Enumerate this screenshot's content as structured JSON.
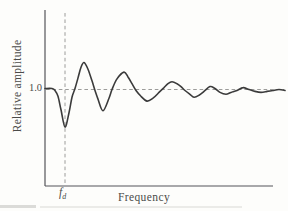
{
  "figure": {
    "ylabel": "Relative amplitude",
    "xlabel": "Frequency",
    "ytick_label": "1.0",
    "fd_symbol": "f",
    "fd_subscript": "d"
  },
  "colors": {
    "background": "#fdfdfb",
    "curve": "#3b3b3b",
    "axis": "#55555a",
    "dashed_line": "#9c9c9a",
    "text": "#4b4b49",
    "scan_artifact": "#c9c9c5"
  },
  "chart_data": {
    "type": "line",
    "title": "",
    "xlabel": "Frequency",
    "ylabel": "Relative amplitude",
    "x_unit": "f / fd (frequency normalized to fd)",
    "xlim": [
      0,
      12
    ],
    "ylim": [
      0,
      1.82
    ],
    "yticks": [
      1.0
    ],
    "xticks": [
      {
        "value": 1.0,
        "label": "fd"
      }
    ],
    "grid": false,
    "legend": null,
    "reference_amplitude": 1.0,
    "dip_frequency": 1.0,
    "dip_amplitude": 0.61,
    "peak_amplitude": 1.28,
    "points": [
      [
        0.0,
        1.01
      ],
      [
        0.35,
        1.01
      ],
      [
        0.5,
        0.99
      ],
      [
        0.65,
        0.93
      ],
      [
        0.8,
        0.79
      ],
      [
        1.0,
        0.61
      ],
      [
        1.2,
        0.76
      ],
      [
        1.35,
        0.92
      ],
      [
        1.5,
        1.01
      ],
      [
        1.65,
        1.12
      ],
      [
        1.8,
        1.23
      ],
      [
        1.95,
        1.28
      ],
      [
        2.15,
        1.21
      ],
      [
        2.35,
        1.09
      ],
      [
        2.5,
        0.99
      ],
      [
        2.65,
        0.9
      ],
      [
        2.9,
        0.78
      ],
      [
        3.2,
        0.91
      ],
      [
        3.35,
        1.0
      ],
      [
        3.6,
        1.11
      ],
      [
        3.95,
        1.18
      ],
      [
        4.15,
        1.13
      ],
      [
        4.35,
        1.06
      ],
      [
        4.55,
        0.99
      ],
      [
        4.8,
        0.93
      ],
      [
        5.1,
        0.88
      ],
      [
        5.4,
        0.91
      ],
      [
        5.7,
        0.97
      ],
      [
        5.95,
        1.02
      ],
      [
        6.15,
        1.06
      ],
      [
        6.35,
        1.08
      ],
      [
        6.6,
        1.06
      ],
      [
        6.8,
        1.03
      ],
      [
        7.0,
        0.99
      ],
      [
        7.25,
        0.95
      ],
      [
        7.45,
        0.92
      ],
      [
        7.7,
        0.94
      ],
      [
        7.95,
        0.98
      ],
      [
        8.25,
        1.03
      ],
      [
        8.5,
        1.01
      ],
      [
        8.75,
        0.97
      ],
      [
        9.05,
        0.95
      ],
      [
        9.3,
        0.97
      ],
      [
        9.6,
        0.99
      ],
      [
        9.9,
        1.02
      ],
      [
        10.2,
        1.0
      ],
      [
        10.5,
        0.98
      ],
      [
        10.8,
        0.97
      ],
      [
        11.1,
        0.98
      ],
      [
        11.4,
        0.99
      ],
      [
        11.7,
        1.0
      ],
      [
        12.0,
        0.99
      ]
    ]
  }
}
